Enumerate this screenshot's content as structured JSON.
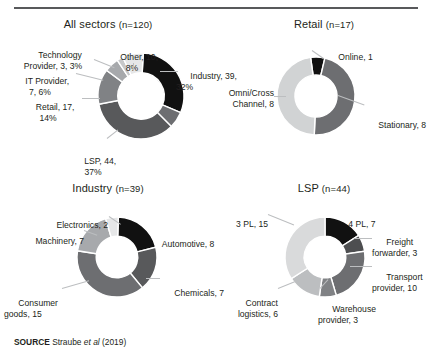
{
  "figure": {
    "source_prefix": "SOURCE",
    "source_author": "Straube",
    "source_etal": "et al",
    "source_year": "(2019)"
  },
  "chart_data": [
    {
      "type": "pie",
      "title": "All sectors",
      "title_n": "(n=120)",
      "total": 120,
      "legend_position": "callout-labels",
      "categories": [
        "Industry",
        "Omni/Cross Channel",
        "LSP",
        "Retail",
        "IT Provider",
        "Technology Provider",
        "Other"
      ],
      "values": [
        39,
        8,
        44,
        17,
        7,
        3,
        10
      ],
      "percents": [
        "32%",
        "",
        "37%",
        "14%",
        "6%",
        "3%",
        "8%"
      ],
      "colors": [
        "#111111",
        "#6d6e71",
        "#58595b",
        "#808285",
        "#a7a9ac",
        "#c7c8ca",
        "#e6e7e8"
      ],
      "labels": [
        {
          "key": "industry",
          "text": "Industry, 39,\n32%"
        },
        {
          "key": "omni-cross-channel",
          "text": "Omni/Cross\nChannel, 8"
        },
        {
          "key": "lsp",
          "text": "LSP, 44,\n37%"
        },
        {
          "key": "retail",
          "text": "Retail, 17,\n14%"
        },
        {
          "key": "it-provider",
          "text": "IT Provider,\n7, 6%"
        },
        {
          "key": "technology-provider",
          "text": "Technology\nProvider, 3, 3%"
        },
        {
          "key": "other",
          "text": "Other, 10,\n8%"
        }
      ]
    },
    {
      "type": "pie",
      "title": "Retail",
      "title_n": "(n=17)",
      "total": 17,
      "legend_position": "callout-labels",
      "categories": [
        "Online",
        "Stationary",
        "Omni/Cross Channel"
      ],
      "values": [
        1,
        8,
        8
      ],
      "colors": [
        "#111111",
        "#6d6e71",
        "#d1d3d4"
      ],
      "labels": [
        {
          "key": "online",
          "text": "Online, 1"
        },
        {
          "key": "stationary",
          "text": "Stationary, 8"
        },
        {
          "key": "omni-cross-channel",
          "text": "Omni/Cross\nChannel, 8"
        }
      ]
    },
    {
      "type": "pie",
      "title": "Industry",
      "title_n": "(n=39)",
      "total": 39,
      "legend_position": "callout-labels",
      "categories": [
        "Automotive",
        "Chemicals",
        "Consumer goods",
        "Machinery",
        "Electronics"
      ],
      "values": [
        8,
        7,
        15,
        7,
        2
      ],
      "colors": [
        "#111111",
        "#58595b",
        "#6d6e71",
        "#a7a9ac",
        "#e6e7e8"
      ],
      "labels": [
        {
          "key": "automotive",
          "text": "Automotive, 8"
        },
        {
          "key": "chemicals",
          "text": "Chemicals, 7"
        },
        {
          "key": "consumer-goods",
          "text": "Consumer\ngoods, 15"
        },
        {
          "key": "machinery",
          "text": "Machinery, 7"
        },
        {
          "key": "electronics",
          "text": "Electronics, 2"
        }
      ]
    },
    {
      "type": "pie",
      "title": "LSP",
      "title_n": "(n=44)",
      "total": 44,
      "legend_position": "callout-labels",
      "categories": [
        "4 PL",
        "Freight forwarder",
        "Transport provider",
        "Warehouse provider",
        "Contract logistics",
        "3 PL"
      ],
      "values": [
        7,
        3,
        10,
        3,
        6,
        15
      ],
      "colors": [
        "#111111",
        "#4d4e50",
        "#6d6e71",
        "#808285",
        "#bcbec0",
        "#d9dadb"
      ],
      "labels": [
        {
          "key": "4pl",
          "text": "4 PL, 7"
        },
        {
          "key": "freight-forwarder",
          "text": "Freight\nforwarder, 3"
        },
        {
          "key": "transport-provider",
          "text": "Transport\nprovider, 10"
        },
        {
          "key": "warehouse-provider",
          "text": "Warehouse\nprovider, 3"
        },
        {
          "key": "contract-logistics",
          "text": "Contract\nlogistics, 6"
        },
        {
          "key": "3pl",
          "text": "3 PL, 15"
        }
      ]
    }
  ]
}
